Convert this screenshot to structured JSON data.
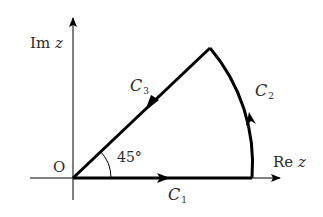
{
  "diagram": {
    "type": "contour-diagram",
    "axes": {
      "imaginary_label_prefix": "Im",
      "imaginary_label_var": "z",
      "real_label_prefix": "Re",
      "real_label_var": "z",
      "origin_label": "O"
    },
    "angle_label": "45°",
    "contours": [
      {
        "name": "C",
        "sub": "1",
        "description": "segment along real axis from O, arrow pointing right"
      },
      {
        "name": "C",
        "sub": "2",
        "description": "circular arc from real axis up to 45° line, arrow pointing up"
      },
      {
        "name": "C",
        "sub": "3",
        "description": "segment along 45° line back to O, arrow pointing toward origin"
      }
    ],
    "colors": {
      "stroke": "#000000",
      "text": "#2a2a2a",
      "background": "#ffffff"
    }
  }
}
